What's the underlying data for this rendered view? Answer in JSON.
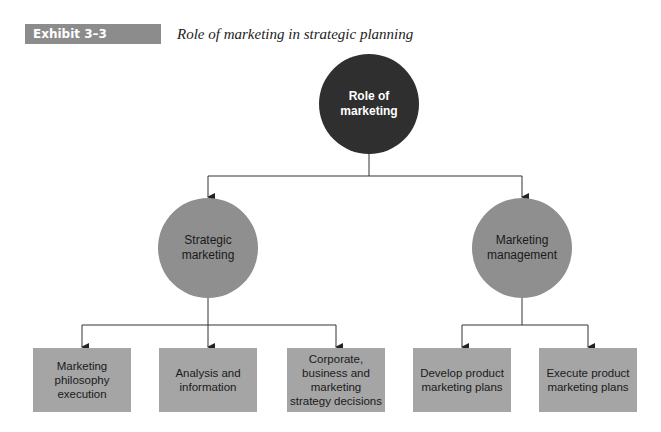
{
  "header": {
    "exhibit_label": "Exhibit 3–3",
    "title": "Role of marketing in strategic planning"
  },
  "nodes": {
    "root": {
      "line1": "Role of",
      "line2": "marketing"
    },
    "left": {
      "line1": "Strategic",
      "line2": "marketing"
    },
    "right": {
      "line1": "Marketing",
      "line2": "management"
    }
  },
  "boxes": [
    {
      "lines": [
        "Marketing",
        "philosophy",
        "execution"
      ]
    },
    {
      "lines": [
        "Analysis and",
        "information"
      ]
    },
    {
      "lines": [
        "Corporate,",
        "business and",
        "marketing",
        "strategy decisions"
      ]
    },
    {
      "lines": [
        "Develop product",
        "marketing plans"
      ]
    },
    {
      "lines": [
        "Execute product",
        "marketing plans"
      ]
    }
  ],
  "colors": {
    "root_fill": "#2f2f2f",
    "level2_fill": "#8f8f8f",
    "box_fill": "#a5a5a5",
    "tag_fill": "#8c8c8c",
    "line": "#333333"
  }
}
